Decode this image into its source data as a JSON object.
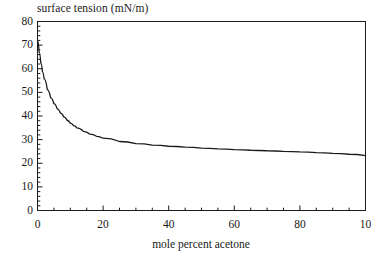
{
  "chart_data": {
    "type": "line",
    "title": "surface tension (mN/m)",
    "xlabel": "mole percent acetone",
    "ylabel": "surface tension (mN/m)",
    "xlim": [
      0,
      100
    ],
    "ylim": [
      0,
      80
    ],
    "grid": false,
    "legend": null,
    "x_ticks": [
      0,
      20,
      40,
      60,
      80,
      100
    ],
    "x_tick_labels": [
      "0",
      "20",
      "40",
      "60",
      "80",
      "10"
    ],
    "x_minor_tick_step": 5,
    "y_ticks": [
      0,
      10,
      20,
      30,
      40,
      50,
      60,
      70,
      80
    ],
    "y_tick_labels": [
      "0",
      "10",
      "20",
      "30",
      "40",
      "50",
      "60",
      "70",
      "80"
    ],
    "y_minor_tick_step": 2,
    "line_color": "#1a1a1a",
    "series": [
      {
        "name": "surface tension",
        "x": [
          0,
          0.5,
          1,
          1.5,
          2,
          3,
          4,
          5,
          6,
          7,
          8,
          9,
          10,
          11,
          12,
          14,
          16,
          18,
          20,
          25,
          30,
          35,
          40,
          45,
          50,
          55,
          60,
          65,
          70,
          75,
          80,
          85,
          90,
          95,
          100
        ],
        "y": [
          72.0,
          67.0,
          62.5,
          58.8,
          55.8,
          51.2,
          47.8,
          45.2,
          43.0,
          41.2,
          39.6,
          38.2,
          37.0,
          35.9,
          35.0,
          33.5,
          32.3,
          31.4,
          30.6,
          29.2,
          28.3,
          27.7,
          27.2,
          26.8,
          26.4,
          26.1,
          25.8,
          25.5,
          25.3,
          25.0,
          24.8,
          24.5,
          24.2,
          23.8,
          23.2
        ]
      }
    ]
  }
}
